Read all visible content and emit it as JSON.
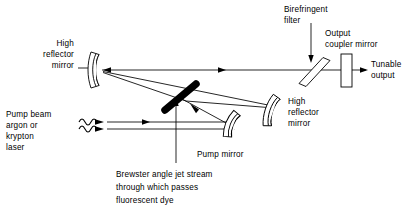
{
  "diagram": {
    "background_color": "#ffffff",
    "line_color": "#000000",
    "labels": {
      "high_reflector_left": [
        "High",
        "reflector",
        "mirror"
      ],
      "high_reflector_right": [
        "High",
        "reflector",
        "mirror"
      ],
      "birefringent_filter": [
        "Birefringent",
        "filter"
      ],
      "output_coupler": [
        "Output",
        "coupler mirror"
      ],
      "tunable_output": [
        "Tunable",
        "output"
      ],
      "pump_beam": [
        "Pump beam",
        "argon or",
        "krypton",
        "laser"
      ],
      "pump_mirror": [
        "Pump mirror"
      ],
      "jet_stream": [
        "Brewster angle jet stream",
        "through which passes",
        "fluorescent dye"
      ]
    },
    "components": [
      {
        "name": "high-reflector-mirror-left",
        "type": "concave-mirror",
        "label": "High reflector mirror"
      },
      {
        "name": "high-reflector-mirror-right",
        "type": "concave-mirror",
        "label": "High reflector mirror"
      },
      {
        "name": "pump-mirror",
        "type": "concave-mirror",
        "label": "Pump mirror"
      },
      {
        "name": "birefringent-filter",
        "type": "tilted-plate",
        "label": "Birefringent filter"
      },
      {
        "name": "output-coupler-mirror",
        "type": "rectangular-mirror",
        "label": "Output coupler mirror"
      },
      {
        "name": "dye-jet-stream",
        "type": "brewster-jet",
        "label": "Brewster angle jet stream"
      }
    ],
    "beams": [
      {
        "name": "cavity-beam-horizontal",
        "label": "Tunable cavity beam"
      },
      {
        "name": "cavity-beam-fold",
        "label": "Folded cavity arm"
      },
      {
        "name": "pump-beam-input",
        "label": "Pump beam input"
      },
      {
        "name": "pump-beam-reflected",
        "label": "Reflected pump beam"
      },
      {
        "name": "tunable-output-beam",
        "label": "Tunable output"
      }
    ]
  }
}
